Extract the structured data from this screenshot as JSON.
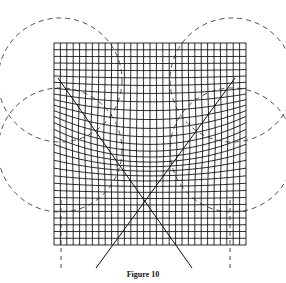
{
  "figure": {
    "caption": "Figure 10",
    "grid": {
      "x0": 54,
      "y0": 43,
      "x1": 246,
      "y1": 245,
      "cells": 30,
      "color": "#111111"
    },
    "cross_lines": [
      {
        "x1": 58,
        "y1": 78,
        "x2": 192,
        "y2": 268
      },
      {
        "x1": 235,
        "y1": 78,
        "x2": 96,
        "y2": 268
      }
    ],
    "dashed_circles": [
      {
        "cx": 60,
        "cy": 80,
        "r": 62
      },
      {
        "cx": 232,
        "cy": 80,
        "r": 62
      },
      {
        "cx": 60,
        "cy": 150,
        "r": 62
      },
      {
        "cx": 232,
        "cy": 150,
        "r": 62
      }
    ],
    "dashed_verticals": [
      {
        "x": 61,
        "y1": 200,
        "y2": 272
      },
      {
        "x": 230,
        "y1": 200,
        "y2": 272
      }
    ]
  }
}
